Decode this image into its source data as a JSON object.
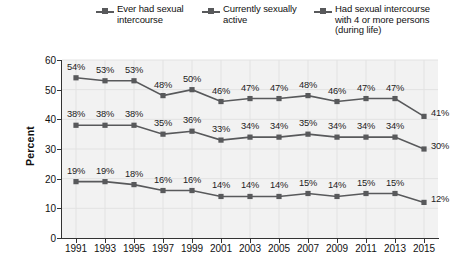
{
  "chart_data": {
    "type": "line",
    "title": "",
    "subtitle": "",
    "xlabel": "",
    "ylabel": "Percent",
    "xlim": [
      1991,
      2015
    ],
    "ylim": [
      0,
      60
    ],
    "yticks": [
      0,
      10,
      20,
      30,
      40,
      50,
      60
    ],
    "grid": true,
    "legend_position": "top",
    "value_label_suffix": "%",
    "categories": [
      1991,
      1993,
      1995,
      1997,
      1999,
      2001,
      2003,
      2005,
      2007,
      2009,
      2011,
      2013,
      2015
    ],
    "x": [
      "1991",
      "1993",
      "1995",
      "1997",
      "1999",
      "2001",
      "2003",
      "2005",
      "2007",
      "2009",
      "2011",
      "2013",
      "2015"
    ],
    "series": [
      {
        "name": "Ever had sexual intercourse",
        "legend_lines": [
          "Ever had sexual",
          "intercourse"
        ],
        "color": "#58595b",
        "marker": "square",
        "values": [
          54,
          53,
          53,
          48,
          50,
          46,
          47,
          47,
          48,
          46,
          47,
          47,
          41
        ],
        "labels": [
          "54%",
          "53%",
          "53%",
          "48%",
          "50%",
          "46%",
          "47%",
          "47%",
          "48%",
          "46%",
          "47%",
          "47%",
          "41%"
        ]
      },
      {
        "name": "Currently sexually active",
        "legend_lines": [
          "Currently sexually",
          "active"
        ],
        "color": "#58595b",
        "marker": "square",
        "values": [
          38,
          38,
          38,
          35,
          36,
          33,
          34,
          34,
          35,
          34,
          34,
          34,
          30
        ],
        "labels": [
          "38%",
          "38%",
          "38%",
          "35%",
          "36%",
          "33%",
          "34%",
          "34%",
          "35%",
          "34%",
          "34%",
          "34%",
          "30%"
        ]
      },
      {
        "name": "Had sexual intercourse with 4 or more persons (during life)",
        "legend_lines": [
          "Had sexual intercourse",
          "with 4 or more persons",
          "(during life)"
        ],
        "color": "#58595b",
        "marker": "square",
        "values": [
          19,
          19,
          18,
          16,
          16,
          14,
          14,
          14,
          15,
          14,
          15,
          15,
          12
        ],
        "labels": [
          "19%",
          "19%",
          "18%",
          "16%",
          "16%",
          "14%",
          "14%",
          "14%",
          "15%",
          "14%",
          "15%",
          "15%",
          "12%"
        ]
      }
    ]
  },
  "colors": {
    "line": "#58595b",
    "plot_background": "#f2f2f2",
    "gridline": "#e2e2e2",
    "axis": "#333333",
    "text": "#111111"
  }
}
